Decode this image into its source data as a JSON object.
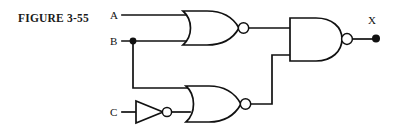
{
  "figure": {
    "caption": "FIGURE 3-55",
    "caption_x": 18,
    "caption_y": 22
  },
  "colors": {
    "background": "#ffffff",
    "line": "#111111",
    "caption": "#1a1a1a",
    "gate_fill": "#ffffff"
  },
  "inputs": [
    {
      "name": "input-a",
      "label": "A",
      "label_x": 110,
      "label_y": 19,
      "wire_y": 15
    },
    {
      "name": "input-b",
      "label": "B",
      "label_x": 110,
      "label_y": 45,
      "wire_y": 41
    },
    {
      "name": "input-c",
      "label": "C",
      "label_x": 110,
      "label_y": 116,
      "wire_y": 112
    }
  ],
  "outputs": [
    {
      "name": "output-x",
      "label": "X",
      "label_x": 368,
      "label_y": 24,
      "dot_x": 376,
      "dot_y": 37
    }
  ],
  "gates": [
    {
      "id": "nor-gate-top",
      "type": "NOR",
      "label": "NOR gate (A, B)",
      "x": 183,
      "y": 11,
      "w": 55,
      "h": 34,
      "bubble_cx": 243,
      "bubble_cy": 28,
      "bubble_r": 5.2,
      "inputs": [
        "A",
        "B"
      ],
      "output_to": "nand-gate"
    },
    {
      "id": "not-gate-c",
      "type": "NOT",
      "label": "Inverter on C",
      "x": 136,
      "y": 101,
      "w": 27,
      "h": 22,
      "bubble_cx": 167,
      "bubble_cy": 112,
      "bubble_r": 4.6,
      "inputs": [
        "C"
      ],
      "output_to": "nor-gate-bottom"
    },
    {
      "id": "nor-gate-bottom",
      "type": "NOR",
      "label": "NOR gate (B, NOT C)",
      "x": 186,
      "y": 86,
      "w": 54,
      "h": 36,
      "bubble_cx": 245,
      "bubble_cy": 104,
      "bubble_r": 5.2,
      "inputs": [
        "B",
        "NOT C"
      ],
      "output_to": "nand-gate"
    },
    {
      "id": "nand-gate",
      "type": "NAND",
      "label": "NAND gate (output stage)",
      "x": 290,
      "y": 18,
      "w": 52,
      "h": 43,
      "bubble_cx": 347,
      "bubble_cy": 39,
      "bubble_r": 5.4,
      "inputs": [
        "NOR top",
        "NOR bottom"
      ],
      "output_to": "X"
    }
  ],
  "junctions": [
    {
      "name": "junction-b-fanout",
      "x": 133,
      "y": 41,
      "r": 3.4
    }
  ],
  "wires": [
    {
      "name": "wire-a-to-nor-top",
      "d": "M 122 15 L 186 15"
    },
    {
      "name": "wire-b-to-nor-top",
      "d": "M 122 41 L 186 41"
    },
    {
      "name": "wire-b-branch-down",
      "d": "M 133 41 L 133 88 L 190 88"
    },
    {
      "name": "wire-c-to-inverter",
      "d": "M 122 112 L 136 112"
    },
    {
      "name": "wire-inverter-to-nor-bot",
      "d": "M 172 112 L 190 112"
    },
    {
      "name": "wire-nor-top-to-nand",
      "d": "M 248 28 L 290 28"
    },
    {
      "name": "wire-nor-bot-to-nand",
      "d": "M 250 104 L 272 104 L 272 55 L 290 55"
    },
    {
      "name": "wire-nand-to-x",
      "d": "M 352 39 L 376 39"
    }
  ]
}
